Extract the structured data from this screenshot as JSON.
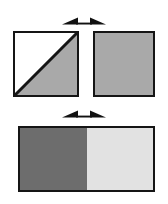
{
  "diagram": {
    "background_color": "#ffffff",
    "outline_color": "#151515",
    "arrows": [
      {
        "id": "arrow-top",
        "name": "double-headed-arrow",
        "direction": "horizontal-both",
        "color": "#111111",
        "label": ""
      },
      {
        "id": "arrow-mid",
        "name": "double-headed-arrow",
        "direction": "horizontal-both",
        "color": "#111111",
        "label": ""
      }
    ],
    "shapes": [
      {
        "id": "square-diagonal",
        "name": "half-shaded-square",
        "type": "square",
        "fill_upper_left": "#ffffff",
        "fill_lower_right": "#a9a9a9",
        "diagonal": "bottom-left-to-top-right",
        "label": ""
      },
      {
        "id": "square-solid",
        "name": "solid-gray-square",
        "type": "square",
        "fill": "#a9a9a9",
        "label": ""
      },
      {
        "id": "rect-split",
        "name": "two-tone-rectangle",
        "type": "rectangle",
        "fill_left": "#6d6d6d",
        "fill_right": "#e2e2e2",
        "split": "vertical-midpoint",
        "label": ""
      }
    ]
  }
}
